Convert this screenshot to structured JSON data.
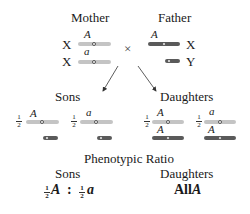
{
  "parents": {
    "mother_label": "Mother",
    "father_label": "Father",
    "cross_symbol": "×",
    "mother": {
      "chromosomes": [
        {
          "type": "X",
          "allele": "A",
          "shade": "light"
        },
        {
          "type": "X",
          "allele": "a",
          "shade": "light"
        }
      ]
    },
    "father": {
      "chromosomes": [
        {
          "type": "X",
          "allele": "A",
          "shade": "dark"
        },
        {
          "type": "Y",
          "allele": "",
          "shade": "dark"
        }
      ]
    }
  },
  "offspring": {
    "sons_label": "Sons",
    "daughters_label": "Daughters",
    "sons": [
      {
        "fraction_num": "1",
        "fraction_den": "2",
        "allele": "A"
      },
      {
        "fraction_num": "1",
        "fraction_den": "2",
        "allele": "a"
      }
    ],
    "daughters": [
      {
        "fraction_num": "1",
        "fraction_den": "2",
        "maternal_allele": "A",
        "paternal_allele": "A"
      },
      {
        "fraction_num": "1",
        "fraction_den": "2",
        "maternal_allele": "a",
        "paternal_allele": "A"
      }
    ]
  },
  "phenotypic_ratio": {
    "title": "Phenotypic Ratio",
    "sons_label": "Sons",
    "daughters_label": "Daughters",
    "sons_ratio": {
      "part1_num": "1",
      "part1_den": "2",
      "part1_allele": "A",
      "separator": ":",
      "part2_num": "1",
      "part2_den": "2",
      "part2_allele": "a"
    },
    "daughters_ratio": {
      "prefix": "All",
      "allele": "A"
    }
  },
  "colors": {
    "maternal_chromosome": "#c4c4c4",
    "paternal_chromosome": "#5a5a5a",
    "text": "#1a1a1a"
  }
}
